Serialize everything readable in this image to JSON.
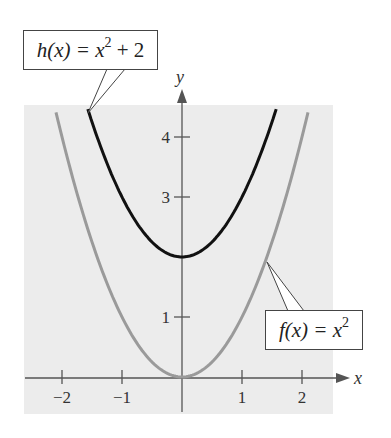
{
  "chart_data": {
    "type": "line",
    "title": "",
    "xlabel": "x",
    "ylabel": "y",
    "xlim": [
      -2.6,
      2.5
    ],
    "ylim": [
      -0.6,
      4.6
    ],
    "grid": false,
    "x_ticks": [
      -2,
      -1,
      1,
      2
    ],
    "x_tick_labels": [
      "−2",
      "−1",
      "1",
      "2"
    ],
    "y_ticks": [
      1,
      3,
      4
    ],
    "y_tick_labels": [
      "1",
      "3",
      "4"
    ],
    "series": [
      {
        "name": "f(x) = x^2",
        "formula": "x^2",
        "color": "#9a9a9a",
        "x": [
          -2.1,
          -2,
          -1.5,
          -1,
          -0.5,
          0,
          0.5,
          1,
          1.5,
          2,
          2.1
        ],
        "y": [
          4.41,
          4,
          2.25,
          1,
          0.25,
          0,
          0.25,
          1,
          2.25,
          4,
          4.41
        ]
      },
      {
        "name": "h(x) = x^2 + 2",
        "formula": "x^2 + 2",
        "color": "#111111",
        "x": [
          -1.57,
          -1.5,
          -1,
          -0.5,
          0,
          0.5,
          1,
          1.5,
          1.57
        ],
        "y": [
          4.46,
          4.25,
          3,
          2.25,
          2,
          2.25,
          3,
          4.25,
          4.46
        ]
      }
    ],
    "annotations": [
      {
        "label": "h(x) = x² + 2",
        "points_to": "h(x) = x^2 + 2",
        "position": "top-left"
      },
      {
        "label": "f(x) = x²",
        "points_to": "f(x) = x^2",
        "position": "right"
      }
    ],
    "legend": "callouts"
  },
  "labels": {
    "x_axis": "x",
    "y_axis": "y",
    "h_callout": {
      "fn": "h",
      "arg": "(x) = x",
      "exp": "2",
      "tail": " + 2"
    },
    "f_callout": {
      "fn": "f",
      "arg": "(x) = x",
      "exp": "2",
      "tail": ""
    }
  },
  "colors": {
    "panel": "#ececec",
    "axis": "#555555",
    "f_curve": "#9a9a9a",
    "h_curve": "#111111"
  }
}
